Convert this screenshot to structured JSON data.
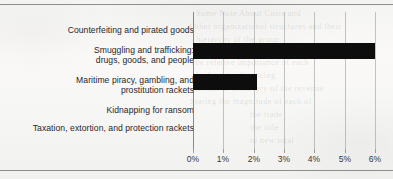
{
  "chart_data": {
    "type": "bar",
    "orientation": "horizontal",
    "title": "",
    "subtitle": "",
    "xlabel": "",
    "ylabel": "",
    "grid": true,
    "legend": false,
    "xlim": [
      0,
      6
    ],
    "xtick_labels": [
      "0%",
      "1%",
      "2%",
      "3%",
      "4%",
      "5%",
      "6%"
    ],
    "xtick_values": [
      0,
      1,
      2,
      3,
      4,
      5,
      6
    ],
    "categories": [
      "Counterfeiting and pirated goods",
      "Smuggling and trafficking: drugs, goods, and people",
      "Maritime piracy, gambling, and prostitution rackets",
      "Kidnapping for ransom",
      "Taxation, extortion, and protection rackets"
    ],
    "category_lines": [
      [
        "Counterfeiting and pirated goods"
      ],
      [
        "Smuggling and trafficking:",
        "drugs, goods, and people"
      ],
      [
        "Maritime piracy, gambling, and",
        "prostitution rackets"
      ],
      [
        "Kidnapping for ransom"
      ],
      [
        "Taxation, extortion, and protection rackets"
      ]
    ],
    "values": [
      0,
      6.0,
      2.1,
      0,
      0
    ],
    "bar_color": "#0d0d0d"
  },
  "page": {
    "background_color": "#f7f7f5",
    "rule_color": "#8d8d8f",
    "bleed_text": [
      "Some Note About Costs and",
      "Other organizational structures and their",
      "hierarchy of the group",
      "The relative importance of each",
      "looking for financing",
      "model of  discovery  of the revenue",
      "Stating the magnitude of each of",
      "the  trade",
      "the  title",
      "to new total"
    ]
  }
}
